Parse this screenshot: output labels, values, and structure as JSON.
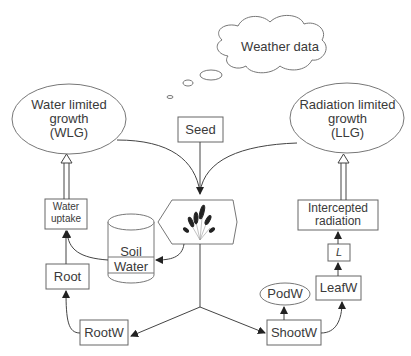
{
  "diagram": {
    "weather": "Weather data",
    "wlg": [
      "Water limited",
      "growth",
      "(WLG)"
    ],
    "llg": [
      "Radiation limited",
      "growth",
      "(LLG)"
    ],
    "seed": "Seed",
    "water_uptake": [
      "Water",
      "uptake"
    ],
    "soil_water": [
      "Soil",
      "Water"
    ],
    "root": "Root",
    "rootw": "RootW",
    "intercepted": [
      "Intercepted",
      "radiation"
    ],
    "lai": "L",
    "leafw": "LeafW",
    "podw": "PodW",
    "shootw": "ShootW",
    "plant_icon": "plant-icon"
  },
  "colors": {
    "stroke": "#666666",
    "text": "#3a3a3a"
  }
}
